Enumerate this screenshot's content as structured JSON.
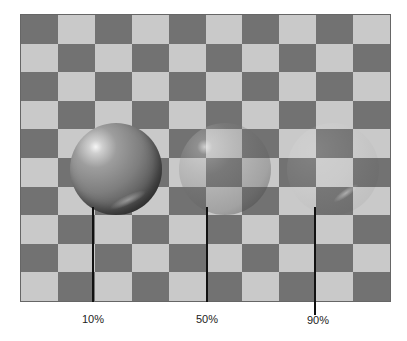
{
  "figure": {
    "board": {
      "columns": 10,
      "rows": 10,
      "dark_color": "#727272",
      "light_color": "#c9c9c9",
      "top_left": "dark"
    },
    "spheres": [
      {
        "label": "10%",
        "center_x": 95,
        "opacity_desc": "mostly opaque"
      },
      {
        "label": "50%",
        "center_x": 206,
        "opacity_desc": "half transparent"
      },
      {
        "label": "90%",
        "center_x": 314,
        "opacity_desc": "mostly transparent"
      }
    ]
  }
}
